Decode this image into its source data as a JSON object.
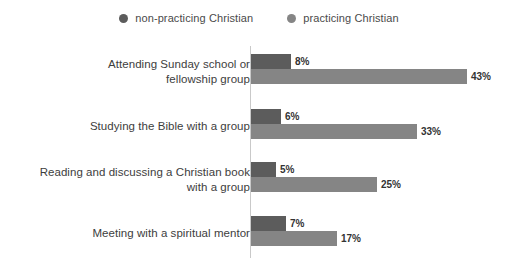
{
  "legend": {
    "items": [
      {
        "label": "non-practicing Christian",
        "color": "#5c5c5c",
        "icon": "circle-marker-icon"
      },
      {
        "label": "practicing Christian",
        "color": "#858585",
        "icon": "circle-marker-icon"
      }
    ]
  },
  "chart_data": {
    "type": "bar",
    "orientation": "horizontal",
    "title": "",
    "subtitle": "",
    "xlabel": "",
    "ylabel": "",
    "xlim": [
      0,
      43
    ],
    "grid": false,
    "legend_position": "top-center",
    "value_suffix": "%",
    "categories": [
      "Attending Sunday school or fellowship group",
      "Studying the Bible with a group",
      "Reading and discussing a Christian book with a group",
      "Meeting with a spiritual mentor"
    ],
    "category_lines": [
      [
        "Attending Sunday school or",
        "fellowship group"
      ],
      [
        "Studying the Bible with a group"
      ],
      [
        "Reading and discussing a Christian book",
        "with a group"
      ],
      [
        "Meeting with a spiritual mentor"
      ]
    ],
    "series": [
      {
        "name": "non-practicing Christian",
        "color": "#5c5c5c",
        "values": [
          8,
          6,
          5,
          7
        ],
        "labels": [
          "8%",
          "6%",
          "5%",
          "7%"
        ]
      },
      {
        "name": "practicing Christian",
        "color": "#858585",
        "values": [
          43,
          33,
          25,
          17
        ],
        "labels": [
          "43%",
          "33%",
          "25%",
          "17%"
        ]
      }
    ]
  },
  "groups": [
    {
      "label_line1": "Attending Sunday school or",
      "label_line2": "fellowship group",
      "np_value": "8%",
      "np_width": 40,
      "p_value": "43%",
      "p_width": 216
    },
    {
      "label_line1": "Studying the Bible with a group",
      "label_line2": "",
      "np_value": "6%",
      "np_width": 30,
      "p_value": "33%",
      "p_width": 166
    },
    {
      "label_line1": "Reading and discussing a Christian book",
      "label_line2": "with a group",
      "np_value": "5%",
      "np_width": 25,
      "p_value": "25%",
      "p_width": 126
    },
    {
      "label_line1": "Meeting with a spiritual mentor",
      "label_line2": "",
      "np_value": "7%",
      "np_width": 35,
      "p_value": "17%",
      "p_width": 86
    }
  ]
}
